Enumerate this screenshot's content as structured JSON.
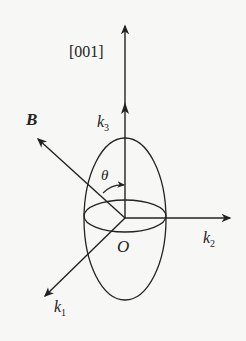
{
  "diagram": {
    "labels": {
      "direction": "[001]",
      "field": "B",
      "k3": "k",
      "k3_sub": "3",
      "k2": "k",
      "k2_sub": "2",
      "k1": "k",
      "k1_sub": "1",
      "angle": "θ",
      "origin": "O"
    },
    "colors": {
      "stroke": "#222222",
      "background": "#f7f7f5"
    }
  }
}
